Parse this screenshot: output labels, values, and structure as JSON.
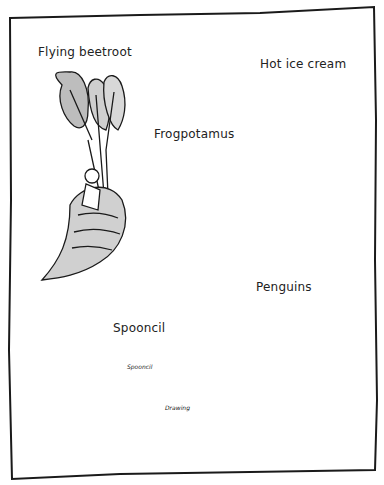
{
  "illustration": {
    "items": [
      {
        "id": "flying-beetroot",
        "label": "Flying beetroot"
      },
      {
        "id": "frogpotamus",
        "label": "Frogpotamus"
      },
      {
        "id": "hot-ice-cream",
        "label": "Hot ice cream"
      },
      {
        "id": "spooncil",
        "label": "Spooncil"
      },
      {
        "id": "penguins",
        "label": "Penguins"
      }
    ],
    "annotations": {
      "spooncil_arrow": "Spooncil",
      "drawing_arrow": "Drawing"
    },
    "colors": {
      "ink": "#1a1a1a",
      "shade": "#a8a8a8",
      "paper": "#ffffff"
    }
  }
}
